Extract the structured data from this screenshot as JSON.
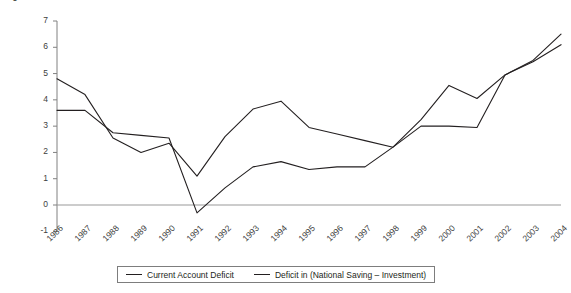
{
  "chart_data": {
    "type": "line",
    "title": "",
    "xlabel": "",
    "ylabel": "% of National Income",
    "ylim": [
      -1,
      7
    ],
    "yticks": [
      -1,
      0,
      1,
      2,
      3,
      4,
      5,
      6,
      7
    ],
    "grid": false,
    "zero_line": true,
    "legend_position": "bottom",
    "categories": [
      "1986",
      "1987",
      "1988",
      "1989",
      "1990",
      "1991",
      "1992",
      "1993",
      "1994",
      "1995",
      "1996",
      "1997",
      "1998",
      "1999",
      "2000",
      "2001",
      "2002",
      "2003",
      "2004"
    ],
    "series": [
      {
        "name": "Current Account Deficit",
        "color": "#231f20",
        "values": [
          3.6,
          3.6,
          2.75,
          2.65,
          2.55,
          -0.3,
          0.65,
          1.45,
          1.65,
          1.35,
          1.45,
          1.45,
          2.2,
          3.0,
          3.0,
          2.95,
          4.95,
          5.45,
          6.1
        ]
      },
      {
        "name": "Deficit in (National Saving – Investment)",
        "color": "#231f20",
        "values": [
          4.8,
          4.2,
          2.55,
          2.0,
          2.35,
          1.1,
          2.6,
          3.65,
          3.95,
          2.95,
          2.7,
          2.45,
          2.2,
          3.25,
          4.55,
          4.05,
          4.95,
          5.5,
          6.5
        ]
      }
    ]
  },
  "axis": {
    "y_title": "% of National Income",
    "y_tick_labels": [
      "7",
      "6",
      "5",
      "4",
      "3",
      "2",
      "1",
      "0",
      "-1"
    ],
    "x_tick_labels": [
      "1986",
      "1987",
      "1988",
      "1989",
      "1990",
      "1991",
      "1992",
      "1993",
      "1994",
      "1995",
      "1996",
      "1997",
      "1998",
      "1999",
      "2000",
      "2001",
      "2002",
      "2003",
      "2004"
    ]
  },
  "legend": {
    "items": [
      {
        "label": "Current Account Deficit"
      },
      {
        "label": "Deficit in (National Saving – Investment)"
      }
    ]
  },
  "style": {
    "line_color": "#231f20",
    "axis_color": "#808080",
    "zero_line_color": "#9a9a9a",
    "tick_text_color": "#3d3d3d",
    "background": "#ffffff"
  }
}
